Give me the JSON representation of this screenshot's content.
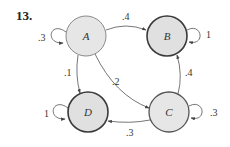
{
  "problem_number": "13.",
  "nodes": [
    {
      "id": "A",
      "label": "A",
      "x": 86,
      "y": 36,
      "r": 20,
      "fill": "#e6e6e6",
      "stroke": "#8a8a8a",
      "stroke_width": 1
    },
    {
      "id": "B",
      "label": "B",
      "x": 167,
      "y": 36,
      "r": 20,
      "fill": "#e0e0e0",
      "stroke": "#3a3a3a",
      "stroke_width": 1.6
    },
    {
      "id": "C",
      "label": "C",
      "x": 169,
      "y": 112,
      "r": 20,
      "fill": "#e6e6e6",
      "stroke": "#555555",
      "stroke_width": 1.3
    },
    {
      "id": "D",
      "label": "D",
      "x": 88,
      "y": 112,
      "r": 20,
      "fill": "#e0e0e0",
      "stroke": "#3a3a3a",
      "stroke_width": 1.6
    }
  ],
  "edges": [
    {
      "from": "A",
      "to": "B",
      "label": ".4"
    },
    {
      "from": "A",
      "to": "D",
      "label": ".1"
    },
    {
      "from": "A",
      "to": "C",
      "label": ".2"
    },
    {
      "from": "C",
      "to": "B",
      "label": ".4"
    },
    {
      "from": "C",
      "to": "D",
      "label": ".3"
    },
    {
      "from": "A",
      "to": "A",
      "label": ".3"
    },
    {
      "from": "B",
      "to": "B",
      "label": "1"
    },
    {
      "from": "C",
      "to": "C",
      "label": ".3"
    },
    {
      "from": "D",
      "to": "D",
      "label": "1"
    }
  ]
}
